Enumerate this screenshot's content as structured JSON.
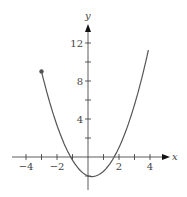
{
  "chart_data": {
    "type": "line",
    "title": "",
    "xlabel": "x",
    "ylabel": "y",
    "xlim": [
      -5,
      5
    ],
    "ylim": [
      -3,
      14
    ],
    "x_ticks": [
      -4,
      -3,
      -2,
      -1,
      0,
      1,
      2,
      3,
      4
    ],
    "x_tick_labels": [
      "−4",
      "−2",
      "2",
      "4"
    ],
    "x_tick_label_values": [
      -4,
      -2,
      2,
      4
    ],
    "y_ticks": [
      -2,
      2,
      4,
      6,
      8,
      10,
      12
    ],
    "y_tick_labels": [
      "4",
      "8",
      "12"
    ],
    "y_tick_label_values": [
      4,
      8,
      12
    ],
    "grid": false,
    "series": [
      {
        "name": "f(x)",
        "x": [
          -3,
          -2.5,
          -2,
          -1.5,
          -1,
          -0.5,
          0,
          0.25,
          0.5,
          1,
          1.5,
          2,
          2.5,
          3,
          3.5,
          3.9
        ],
        "values": [
          8.5,
          5.5,
          3,
          1,
          -0.5,
          -1.5,
          -2,
          -2.06,
          -2,
          -1.5,
          -0.5,
          1,
          2.5,
          4.5,
          8.5,
          12
        ],
        "start_point_marker": {
          "x": -3,
          "y": 9,
          "filled": true
        }
      }
    ],
    "colors": {
      "curve": "#555555",
      "axis": "#333333"
    }
  }
}
